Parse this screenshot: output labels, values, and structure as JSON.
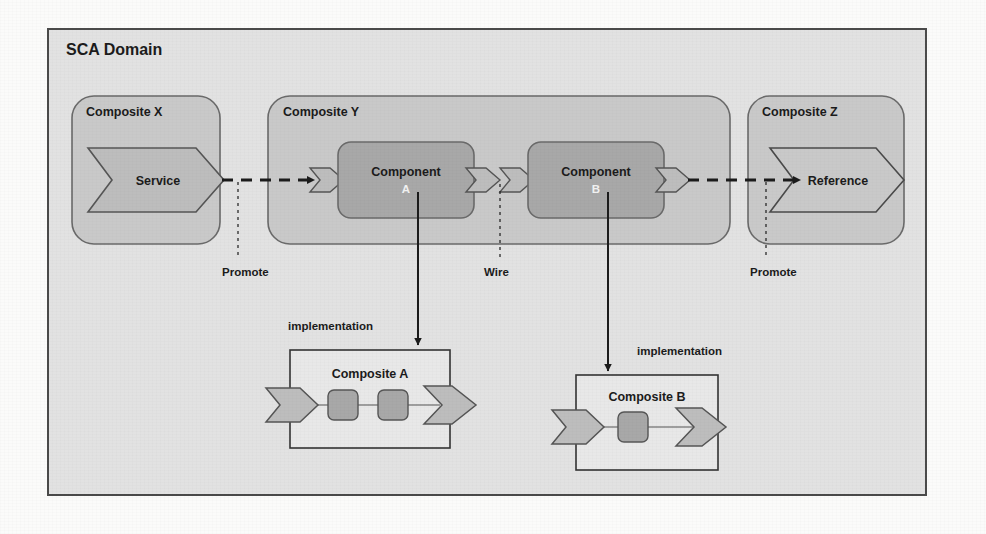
{
  "figure": {
    "domain_box": {
      "title": "SCA Domain"
    },
    "composites": [
      {
        "id": "x",
        "label": "Composite X",
        "shape": "rounded-container"
      },
      {
        "id": "y",
        "label": "Composite Y",
        "shape": "rounded-container"
      },
      {
        "id": "z",
        "label": "Composite Z",
        "shape": "rounded-container"
      }
    ],
    "service_shape": {
      "label": "Service",
      "kind": "service-chevron"
    },
    "reference_shape": {
      "label": "Reference",
      "kind": "reference-chevron"
    },
    "components": [
      {
        "id": "a",
        "label": "Component",
        "sublabel": "A"
      },
      {
        "id": "b",
        "label": "Component",
        "sublabel": "B"
      }
    ],
    "annotations": [
      {
        "id": "promote-left",
        "label": "Promote"
      },
      {
        "id": "wire",
        "label": "Wire"
      },
      {
        "id": "promote-right",
        "label": "Promote"
      },
      {
        "id": "impl-a",
        "label": "implementation"
      },
      {
        "id": "impl-b",
        "label": "implementation"
      }
    ],
    "implementations": [
      {
        "id": "comp-a",
        "label": "Composite A",
        "inner_nodes": 2
      },
      {
        "id": "comp-b",
        "label": "Composite B",
        "inner_nodes": 1
      }
    ],
    "colors": {
      "page_background": "#fbfbfa",
      "domain_fill": "#e2e2e2",
      "domain_stroke": "#4a4a4a",
      "composite_fill": "#c9c9c9",
      "composite_stroke": "#6a6a6a",
      "component_fill": "#a8a8a8",
      "component_stroke": "#6a6a6a",
      "chevron_fill": "#bdbdbd",
      "chevron_stroke": "#555555",
      "impl_box_fill": "#e8e8e8",
      "impl_box_stroke": "#333333",
      "line": "#1b1b1b",
      "text": "#1b1b1b",
      "text_inverse": "#f2f2f2"
    }
  }
}
